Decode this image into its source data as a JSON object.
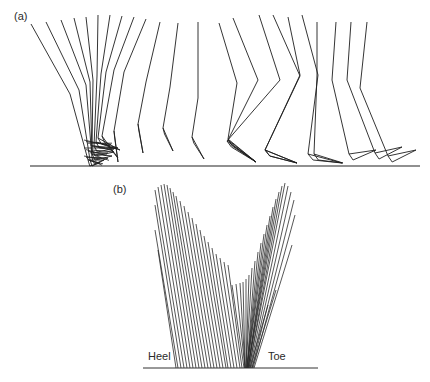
{
  "panels": {
    "a": {
      "label": "(a)",
      "ground": {
        "x1": 30,
        "x2": 420,
        "y": 166
      },
      "hip_y": 22,
      "legs": [
        {
          "hip": [
            31,
            24
          ],
          "knee": [
            70,
            94
          ],
          "ankle": [
            88,
            160
          ],
          "toe": [
            100,
            163
          ]
        },
        {
          "hip": [
            46,
            22
          ],
          "knee": [
            79,
            90
          ],
          "ankle": [
            90,
            160
          ],
          "toe": [
            104,
            160
          ]
        },
        {
          "hip": [
            61,
            20
          ],
          "knee": [
            86,
            85
          ],
          "ankle": [
            92,
            158
          ],
          "toe": [
            108,
            158
          ]
        },
        {
          "hip": [
            74,
            18
          ],
          "knee": [
            90,
            82
          ],
          "ankle": [
            92,
            154
          ],
          "toe": [
            112,
            156
          ]
        },
        {
          "hip": [
            86,
            17
          ],
          "knee": [
            93,
            80
          ],
          "ankle": [
            92,
            150
          ],
          "toe": [
            114,
            152
          ]
        },
        {
          "hip": [
            98,
            15
          ],
          "knee": [
            97,
            76
          ],
          "ankle": [
            94,
            146
          ],
          "toe": [
            116,
            148
          ]
        },
        {
          "hip": [
            110,
            15
          ],
          "knee": [
            101,
            74
          ],
          "ankle": [
            96,
            142
          ],
          "toe": [
            118,
            148
          ]
        },
        {
          "hip": [
            122,
            16
          ],
          "knee": [
            106,
            72
          ],
          "ankle": [
            98,
            138
          ],
          "toe": [
            120,
            150
          ]
        },
        {
          "hip": [
            134,
            17
          ],
          "knee": [
            114,
            70
          ],
          "ankle": [
            102,
            136
          ],
          "toe": [
            118,
            158
          ]
        },
        {
          "hip": [
            146,
            19
          ],
          "knee": [
            124,
            72
          ],
          "ankle": [
            114,
            131
          ],
          "toe": [
            118,
            162
          ]
        },
        {
          "hip": [
            160,
            22
          ],
          "knee": [
            146,
            82
          ],
          "ankle": [
            138,
            124
          ],
          "toe": [
            143,
            153
          ]
        },
        {
          "hip": [
            178,
            23
          ],
          "knee": [
            170,
            87
          ],
          "ankle": [
            163,
            128
          ],
          "toe": [
            173,
            151
          ]
        },
        {
          "hip": [
            198,
            22
          ],
          "knee": [
            198,
            98
          ],
          "ankle": [
            192,
            137
          ],
          "toe": [
            204,
            159
          ]
        },
        {
          "hip": [
            219,
            23
          ],
          "knee": [
            237,
            83
          ],
          "ankle": [
            228,
            139
          ],
          "toe": [
            256,
            162
          ]
        },
        {
          "hip": [
            233,
            18
          ],
          "knee": [
            258,
            80
          ],
          "ankle": [
            228,
            140
          ],
          "toe": [
            256,
            162
          ]
        },
        {
          "hip": [
            259,
            15
          ],
          "knee": [
            280,
            80
          ],
          "ankle": [
            227,
            141
          ],
          "toe": [
            256,
            162
          ]
        },
        {
          "hip": [
            273,
            15
          ],
          "knee": [
            300,
            76
          ],
          "ankle": [
            265,
            150
          ],
          "toe": [
            297,
            163
          ]
        },
        {
          "hip": [
            288,
            17
          ],
          "knee": [
            300,
            75
          ],
          "ankle": [
            265,
            150
          ],
          "toe": [
            297,
            163
          ]
        },
        {
          "hip": [
            302,
            15
          ],
          "knee": [
            318,
            75
          ],
          "ankle": [
            308,
            154
          ],
          "toe": [
            342,
            163
          ]
        },
        {
          "hip": [
            317,
            22
          ],
          "knee": [
            317,
            75
          ],
          "ankle": [
            314,
            154
          ],
          "toe": [
            343,
            163
          ]
        },
        {
          "hip": [
            336,
            22
          ],
          "knee": [
            332,
            80
          ],
          "ankle": [
            349,
            154
          ],
          "toe": [
            376,
            150
          ]
        },
        {
          "hip": [
            351,
            22
          ],
          "knee": [
            347,
            80
          ],
          "ankle": [
            375,
            153
          ],
          "toe": [
            402,
            147
          ]
        },
        {
          "hip": [
            367,
            22
          ],
          "knee": [
            360,
            88
          ],
          "ankle": [
            388,
            156
          ],
          "toe": [
            416,
            150
          ]
        }
      ]
    },
    "b": {
      "label": "(b)",
      "heel_label": "Heel",
      "toe_label": "Toe",
      "ground": {
        "x1": 143,
        "x2": 318,
        "y": 368
      },
      "heel_lines": [
        {
          "x_top": 155,
          "y_top": 190,
          "x_bot": 184,
          "y_bot": 368
        },
        {
          "x_top": 158,
          "y_top": 187,
          "x_bot": 187,
          "y_bot": 368
        },
        {
          "x_top": 161,
          "y_top": 185,
          "x_bot": 190,
          "y_bot": 368
        },
        {
          "x_top": 164,
          "y_top": 184,
          "x_bot": 193,
          "y_bot": 368
        },
        {
          "x_top": 167,
          "y_top": 185,
          "x_bot": 196,
          "y_bot": 368
        },
        {
          "x_top": 170,
          "y_top": 188,
          "x_bot": 199,
          "y_bot": 368
        },
        {
          "x_top": 173,
          "y_top": 192,
          "x_bot": 202,
          "y_bot": 368
        },
        {
          "x_top": 176,
          "y_top": 196,
          "x_bot": 205,
          "y_bot": 368
        },
        {
          "x_top": 180,
          "y_top": 201,
          "x_bot": 208,
          "y_bot": 368
        },
        {
          "x_top": 184,
          "y_top": 206,
          "x_bot": 211,
          "y_bot": 368
        },
        {
          "x_top": 188,
          "y_top": 212,
          "x_bot": 214,
          "y_bot": 368
        },
        {
          "x_top": 192,
          "y_top": 218,
          "x_bot": 217,
          "y_bot": 368
        },
        {
          "x_top": 196,
          "y_top": 224,
          "x_bot": 220,
          "y_bot": 368
        },
        {
          "x_top": 200,
          "y_top": 230,
          "x_bot": 223,
          "y_bot": 368
        },
        {
          "x_top": 204,
          "y_top": 236,
          "x_bot": 226,
          "y_bot": 368
        },
        {
          "x_top": 208,
          "y_top": 242,
          "x_bot": 228,
          "y_bot": 368
        },
        {
          "x_top": 212,
          "y_top": 248,
          "x_bot": 231,
          "y_bot": 368
        },
        {
          "x_top": 216,
          "y_top": 254,
          "x_bot": 234,
          "y_bot": 368
        },
        {
          "x_top": 220,
          "y_top": 258,
          "x_bot": 237,
          "y_bot": 368
        },
        {
          "x_top": 224,
          "y_top": 262,
          "x_bot": 240,
          "y_bot": 368
        },
        {
          "x_top": 228,
          "y_top": 265,
          "x_bot": 242,
          "y_bot": 368
        },
        {
          "x_top": 232,
          "y_top": 285,
          "x_bot": 244,
          "y_bot": 368
        },
        {
          "x_top": 236,
          "y_top": 284,
          "x_bot": 245,
          "y_bot": 368
        },
        {
          "x_top": 155,
          "y_top": 205,
          "x_bot": 181,
          "y_bot": 368
        },
        {
          "x_top": 155,
          "y_top": 230,
          "x_bot": 178,
          "y_bot": 368
        },
        {
          "x_top": 158,
          "y_top": 250,
          "x_bot": 176,
          "y_bot": 368
        }
      ],
      "toe_lines": [
        {
          "x_top": 240,
          "y_top": 283,
          "x_bot": 245,
          "y_bot": 368
        },
        {
          "x_top": 243,
          "y_top": 282,
          "x_bot": 245,
          "y_bot": 368
        },
        {
          "x_top": 246,
          "y_top": 279,
          "x_bot": 246,
          "y_bot": 368
        },
        {
          "x_top": 249,
          "y_top": 275,
          "x_bot": 246,
          "y_bot": 368
        },
        {
          "x_top": 252,
          "y_top": 268,
          "x_bot": 246,
          "y_bot": 368
        },
        {
          "x_top": 255,
          "y_top": 261,
          "x_bot": 247,
          "y_bot": 368
        },
        {
          "x_top": 258,
          "y_top": 252,
          "x_bot": 247,
          "y_bot": 368
        },
        {
          "x_top": 261,
          "y_top": 243,
          "x_bot": 247,
          "y_bot": 368
        },
        {
          "x_top": 264,
          "y_top": 234,
          "x_bot": 247,
          "y_bot": 368
        },
        {
          "x_top": 267,
          "y_top": 225,
          "x_bot": 247,
          "y_bot": 368
        },
        {
          "x_top": 270,
          "y_top": 216,
          "x_bot": 248,
          "y_bot": 368
        },
        {
          "x_top": 273,
          "y_top": 207,
          "x_bot": 248,
          "y_bot": 368
        },
        {
          "x_top": 276,
          "y_top": 199,
          "x_bot": 248,
          "y_bot": 368
        },
        {
          "x_top": 279,
          "y_top": 192,
          "x_bot": 248,
          "y_bot": 368
        },
        {
          "x_top": 282,
          "y_top": 186,
          "x_bot": 249,
          "y_bot": 368
        },
        {
          "x_top": 285,
          "y_top": 183,
          "x_bot": 249,
          "y_bot": 368
        },
        {
          "x_top": 288,
          "y_top": 186,
          "x_bot": 250,
          "y_bot": 368
        },
        {
          "x_top": 291,
          "y_top": 192,
          "x_bot": 251,
          "y_bot": 368
        },
        {
          "x_top": 294,
          "y_top": 200,
          "x_bot": 252,
          "y_bot": 368
        },
        {
          "x_top": 295,
          "y_top": 215,
          "x_bot": 253,
          "y_bot": 368
        },
        {
          "x_top": 292,
          "y_top": 245,
          "x_bot": 254,
          "y_bot": 368
        },
        {
          "x_top": 276,
          "y_top": 290,
          "x_bot": 252,
          "y_bot": 368
        },
        {
          "x_top": 268,
          "y_top": 305,
          "x_bot": 250,
          "y_bot": 368
        }
      ]
    }
  }
}
